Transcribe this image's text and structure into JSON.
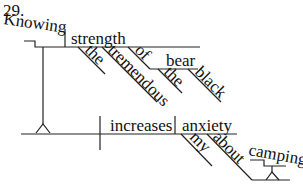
{
  "problem_number": "29.",
  "words": {
    "knowing": "Knowing",
    "strength": "strength",
    "the1": "the",
    "tremendous": "tremendous",
    "of": "of",
    "bear": "bear",
    "the2": "the",
    "black": "black",
    "increases": "increases",
    "anxiety": "anxiety",
    "my": "my",
    "about": "about",
    "camping": "camping"
  }
}
